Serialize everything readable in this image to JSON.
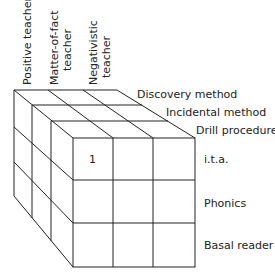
{
  "diagram": {
    "title": "",
    "teacher_types": [
      {
        "line1": "Positive teacher",
        "line2": ""
      },
      {
        "line1": "Matter-of-fact",
        "line2": "teacher"
      },
      {
        "line1": "Negativistic",
        "line2": "teacher"
      }
    ],
    "methods": [
      "Discovery method",
      "Incidental method",
      "Drill procedure"
    ],
    "materials": [
      "i.t.a.",
      "Phonics",
      "Basal reader"
    ],
    "cell_label": "1"
  }
}
